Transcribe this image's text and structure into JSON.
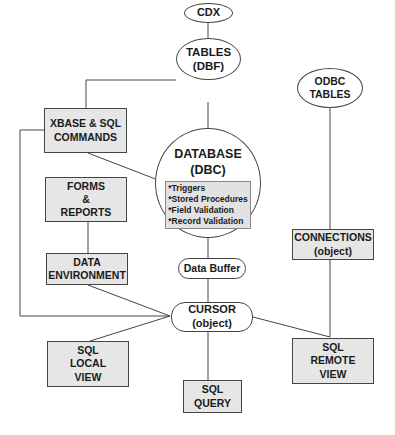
{
  "nodes": {
    "cdx": {
      "label": "CDX"
    },
    "tables": {
      "line1": "TABLES",
      "line2": "(DBF)"
    },
    "xbase": {
      "line1": "XBASE & SQL",
      "line2": "COMMANDS"
    },
    "database": {
      "line1": "DATABASE",
      "line2": "(DBC)",
      "features": [
        "*Triggers",
        "*Stored Procedures",
        "*Field Validation",
        "*Record Validation"
      ]
    },
    "odbc": {
      "line1": "ODBC",
      "line2": "TABLES"
    },
    "forms": {
      "line1": "FORMS",
      "line2": "&",
      "line3": "REPORTS"
    },
    "connections": {
      "line1": "CONNECTIONS",
      "line2": "(object)"
    },
    "data_env": {
      "line1": "DATA",
      "line2": "ENVIRONMENT"
    },
    "data_buffer": {
      "label": "Data Buffer"
    },
    "cursor": {
      "line1": "CURSOR",
      "line2": "(object)"
    },
    "sql_local": {
      "line1": "SQL",
      "line2": "LOCAL",
      "line3": "VIEW"
    },
    "sql_remote": {
      "line1": "SQL",
      "line2": "REMOTE",
      "line3": "VIEW"
    },
    "sql_query": {
      "line1": "SQL",
      "line2": "QUERY"
    }
  },
  "colors": {
    "box_fill": "#e6e6e6",
    "stroke": "#444444",
    "background": "#ffffff"
  }
}
